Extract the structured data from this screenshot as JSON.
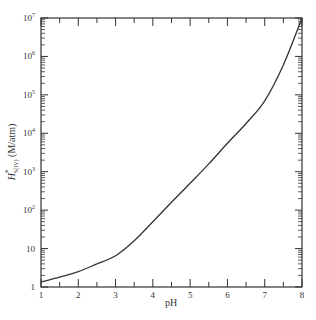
{
  "chart_data": {
    "type": "line",
    "title": "",
    "xlabel": "pH",
    "ylabel": "H*S(IV) (M/atm)",
    "ylabel_main": "H",
    "ylabel_sup": "*",
    "ylabel_sub": "S(IV)",
    "ylabel_units": "(M/atm)",
    "yscale": "log",
    "xlim": [
      1,
      8
    ],
    "ylim": [
      1,
      10000000
    ],
    "grid": false,
    "legend": null,
    "x_ticks": [
      "1",
      "2",
      "3",
      "4",
      "5",
      "6",
      "7",
      "8"
    ],
    "y_ticks": [
      {
        "value": 1,
        "label": "1"
      },
      {
        "value": 10,
        "label": "10"
      },
      {
        "value": 100,
        "label": "10",
        "exp": "2"
      },
      {
        "value": 1000,
        "label": "10",
        "exp": "3"
      },
      {
        "value": 10000,
        "label": "10",
        "exp": "4"
      },
      {
        "value": 100000,
        "label": "10",
        "exp": "5"
      },
      {
        "value": 1000000,
        "label": "10",
        "exp": "6"
      },
      {
        "value": 10000000,
        "label": "10",
        "exp": "7"
      }
    ],
    "series": [
      {
        "name": "H*S(IV)",
        "x": [
          1.0,
          1.5,
          2.0,
          2.5,
          3.0,
          3.5,
          4.0,
          4.5,
          5.0,
          5.5,
          6.0,
          6.5,
          7.0,
          7.5,
          8.0
        ],
        "values": [
          1.35,
          1.8,
          2.5,
          4.0,
          6.5,
          16,
          50,
          160,
          500,
          1600,
          5500,
          18000,
          70000,
          600000,
          10000000
        ],
        "color": "#333333"
      }
    ]
  }
}
